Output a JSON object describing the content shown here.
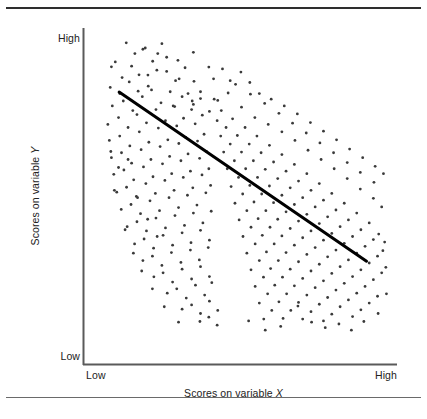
{
  "figure": {
    "title": "",
    "background": "#ffffff",
    "width": 427,
    "height": 419
  },
  "axes": {
    "y": {
      "title_prefix": "Scores on variable ",
      "title_variable": "Y",
      "title_full": "Scores on variable Y",
      "high_label": "High",
      "low_label": "Low",
      "line_color": "#5a5a5a"
    },
    "x": {
      "title_prefix": "Scores on variable ",
      "title_variable": "X",
      "title_full": "Scores on variable X",
      "low_label": "Low",
      "high_label": "High",
      "line_color": "#5a5a5a"
    }
  },
  "rules": {
    "top_color": "#2e2e2e",
    "bottom_color": "#6a6a6a"
  },
  "chart_data": {
    "type": "scatter",
    "title": "",
    "xlabel": "Scores on variable X",
    "ylabel": "Scores on variable Y",
    "xlim": [
      0,
      1
    ],
    "ylim": [
      0,
      1
    ],
    "xtick_labels": [
      "Low",
      "High"
    ],
    "ytick_labels": [
      "Low",
      "High"
    ],
    "grid": false,
    "legend": null,
    "relationship": "negative correlation",
    "point_color": "#3a3a3a",
    "point_size_px": 1.4,
    "trendline": {
      "color": "#000000",
      "width_px": 3,
      "x0": 0.088,
      "y0": 0.805,
      "x1": 0.921,
      "y1": 0.256
    },
    "points": [
      [
        0.075,
        0.903
      ],
      [
        0.112,
        0.965
      ],
      [
        0.141,
        0.93
      ],
      [
        0.062,
        0.887
      ],
      [
        0.098,
        0.852
      ],
      [
        0.13,
        0.889
      ],
      [
        0.168,
        0.944
      ],
      [
        0.201,
        0.905
      ],
      [
        0.058,
        0.82
      ],
      [
        0.09,
        0.8
      ],
      [
        0.122,
        0.838
      ],
      [
        0.155,
        0.861
      ],
      [
        0.186,
        0.824
      ],
      [
        0.215,
        0.876
      ],
      [
        0.248,
        0.918
      ],
      [
        0.065,
        0.76
      ],
      [
        0.102,
        0.776
      ],
      [
        0.134,
        0.745
      ],
      [
        0.166,
        0.79
      ],
      [
        0.197,
        0.812
      ],
      [
        0.229,
        0.77
      ],
      [
        0.26,
        0.806
      ],
      [
        0.29,
        0.848
      ],
      [
        0.32,
        0.8
      ],
      [
        0.05,
        0.7
      ],
      [
        0.086,
        0.722
      ],
      [
        0.118,
        0.69
      ],
      [
        0.148,
        0.732
      ],
      [
        0.18,
        0.705
      ],
      [
        0.212,
        0.748
      ],
      [
        0.244,
        0.712
      ],
      [
        0.275,
        0.758
      ],
      [
        0.305,
        0.72
      ],
      [
        0.338,
        0.765
      ],
      [
        0.368,
        0.73
      ],
      [
        0.055,
        0.648
      ],
      [
        0.09,
        0.662
      ],
      [
        0.124,
        0.63
      ],
      [
        0.156,
        0.676
      ],
      [
        0.188,
        0.642
      ],
      [
        0.22,
        0.688
      ],
      [
        0.252,
        0.65
      ],
      [
        0.282,
        0.695
      ],
      [
        0.312,
        0.658
      ],
      [
        0.344,
        0.702
      ],
      [
        0.374,
        0.668
      ],
      [
        0.062,
        0.592
      ],
      [
        0.096,
        0.608
      ],
      [
        0.13,
        0.574
      ],
      [
        0.162,
        0.618
      ],
      [
        0.195,
        0.586
      ],
      [
        0.226,
        0.628
      ],
      [
        0.258,
        0.596
      ],
      [
        0.289,
        0.638
      ],
      [
        0.32,
        0.604
      ],
      [
        0.352,
        0.646
      ],
      [
        0.382,
        0.612
      ],
      [
        0.07,
        0.538
      ],
      [
        0.104,
        0.552
      ],
      [
        0.137,
        0.52
      ],
      [
        0.17,
        0.562
      ],
      [
        0.202,
        0.53
      ],
      [
        0.234,
        0.572
      ],
      [
        0.265,
        0.54
      ],
      [
        0.296,
        0.582
      ],
      [
        0.328,
        0.548
      ],
      [
        0.359,
        0.59
      ],
      [
        0.39,
        0.556
      ],
      [
        0.08,
        0.48
      ],
      [
        0.113,
        0.496
      ],
      [
        0.146,
        0.466
      ],
      [
        0.178,
        0.508
      ],
      [
        0.21,
        0.476
      ],
      [
        0.242,
        0.518
      ],
      [
        0.273,
        0.486
      ],
      [
        0.304,
        0.528
      ],
      [
        0.336,
        0.494
      ],
      [
        0.367,
        0.536
      ],
      [
        0.396,
        0.502
      ],
      [
        0.095,
        0.424
      ],
      [
        0.128,
        0.44
      ],
      [
        0.16,
        0.41
      ],
      [
        0.192,
        0.452
      ],
      [
        0.224,
        0.42
      ],
      [
        0.256,
        0.462
      ],
      [
        0.288,
        0.43
      ],
      [
        0.318,
        0.47
      ],
      [
        0.35,
        0.438
      ],
      [
        0.38,
        0.478
      ],
      [
        0.115,
        0.368
      ],
      [
        0.148,
        0.384
      ],
      [
        0.18,
        0.354
      ],
      [
        0.212,
        0.396
      ],
      [
        0.244,
        0.364
      ],
      [
        0.276,
        0.404
      ],
      [
        0.308,
        0.372
      ],
      [
        0.338,
        0.412
      ],
      [
        0.37,
        0.38
      ],
      [
        0.398,
        0.418
      ],
      [
        0.14,
        0.312
      ],
      [
        0.172,
        0.328
      ],
      [
        0.204,
        0.298
      ],
      [
        0.236,
        0.34
      ],
      [
        0.268,
        0.308
      ],
      [
        0.3,
        0.348
      ],
      [
        0.33,
        0.316
      ],
      [
        0.362,
        0.356
      ],
      [
        0.392,
        0.324
      ],
      [
        0.168,
        0.258
      ],
      [
        0.2,
        0.272
      ],
      [
        0.232,
        0.242
      ],
      [
        0.264,
        0.284
      ],
      [
        0.296,
        0.252
      ],
      [
        0.328,
        0.292
      ],
      [
        0.358,
        0.26
      ],
      [
        0.388,
        0.3
      ],
      [
        0.205,
        0.205
      ],
      [
        0.236,
        0.218
      ],
      [
        0.268,
        0.188
      ],
      [
        0.3,
        0.23
      ],
      [
        0.332,
        0.198
      ],
      [
        0.362,
        0.238
      ],
      [
        0.392,
        0.206
      ],
      [
        0.25,
        0.152
      ],
      [
        0.282,
        0.166
      ],
      [
        0.314,
        0.136
      ],
      [
        0.345,
        0.178
      ],
      [
        0.376,
        0.146
      ],
      [
        0.4,
        0.186
      ],
      [
        0.3,
        0.1
      ],
      [
        0.332,
        0.114
      ],
      [
        0.362,
        0.086
      ],
      [
        0.392,
        0.126
      ],
      [
        0.42,
        0.096
      ],
      [
        0.36,
        0.06
      ],
      [
        0.39,
        0.074
      ],
      [
        0.418,
        0.048
      ],
      [
        0.152,
        0.808
      ],
      [
        0.185,
        0.86
      ],
      [
        0.218,
        0.93
      ],
      [
        0.248,
        0.872
      ],
      [
        0.278,
        0.842
      ],
      [
        0.31,
        0.884
      ],
      [
        0.34,
        0.84
      ],
      [
        0.27,
        0.76
      ],
      [
        0.3,
        0.79
      ],
      [
        0.332,
        0.748
      ],
      [
        0.362,
        0.784
      ],
      [
        0.392,
        0.742
      ],
      [
        0.42,
        0.778
      ],
      [
        0.418,
        0.712
      ],
      [
        0.43,
        0.662
      ],
      [
        0.44,
        0.61
      ],
      [
        0.452,
        0.556
      ],
      [
        0.465,
        0.498
      ],
      [
        0.478,
        0.444
      ],
      [
        0.492,
        0.39
      ],
      [
        0.505,
        0.336
      ],
      [
        0.518,
        0.282
      ],
      [
        0.532,
        0.228
      ],
      [
        0.546,
        0.174
      ],
      [
        0.56,
        0.12
      ],
      [
        0.575,
        0.068
      ],
      [
        0.432,
        0.745
      ],
      [
        0.448,
        0.69
      ],
      [
        0.462,
        0.636
      ],
      [
        0.476,
        0.582
      ],
      [
        0.49,
        0.528
      ],
      [
        0.504,
        0.474
      ],
      [
        0.518,
        0.42
      ],
      [
        0.532,
        0.366
      ],
      [
        0.546,
        0.312
      ],
      [
        0.56,
        0.258
      ],
      [
        0.574,
        0.204
      ],
      [
        0.588,
        0.15
      ],
      [
        0.602,
        0.096
      ],
      [
        0.47,
        0.718
      ],
      [
        0.486,
        0.664
      ],
      [
        0.5,
        0.61
      ],
      [
        0.514,
        0.556
      ],
      [
        0.528,
        0.502
      ],
      [
        0.542,
        0.448
      ],
      [
        0.556,
        0.394
      ],
      [
        0.57,
        0.34
      ],
      [
        0.584,
        0.286
      ],
      [
        0.598,
        0.232
      ],
      [
        0.612,
        0.178
      ],
      [
        0.626,
        0.124
      ],
      [
        0.64,
        0.07
      ],
      [
        0.512,
        0.69
      ],
      [
        0.526,
        0.636
      ],
      [
        0.54,
        0.582
      ],
      [
        0.554,
        0.528
      ],
      [
        0.568,
        0.474
      ],
      [
        0.582,
        0.42
      ],
      [
        0.596,
        0.366
      ],
      [
        0.61,
        0.312
      ],
      [
        0.624,
        0.258
      ],
      [
        0.638,
        0.204
      ],
      [
        0.652,
        0.15
      ],
      [
        0.666,
        0.096
      ],
      [
        0.552,
        0.662
      ],
      [
        0.566,
        0.608
      ],
      [
        0.58,
        0.554
      ],
      [
        0.594,
        0.5
      ],
      [
        0.608,
        0.446
      ],
      [
        0.622,
        0.392
      ],
      [
        0.636,
        0.338
      ],
      [
        0.65,
        0.284
      ],
      [
        0.664,
        0.23
      ],
      [
        0.678,
        0.176
      ],
      [
        0.692,
        0.122
      ],
      [
        0.706,
        0.068
      ],
      [
        0.594,
        0.632
      ],
      [
        0.608,
        0.578
      ],
      [
        0.622,
        0.524
      ],
      [
        0.636,
        0.47
      ],
      [
        0.65,
        0.416
      ],
      [
        0.664,
        0.362
      ],
      [
        0.678,
        0.308
      ],
      [
        0.692,
        0.254
      ],
      [
        0.706,
        0.2
      ],
      [
        0.72,
        0.146
      ],
      [
        0.734,
        0.092
      ],
      [
        0.636,
        0.602
      ],
      [
        0.65,
        0.548
      ],
      [
        0.664,
        0.494
      ],
      [
        0.678,
        0.44
      ],
      [
        0.692,
        0.386
      ],
      [
        0.706,
        0.332
      ],
      [
        0.72,
        0.278
      ],
      [
        0.734,
        0.224
      ],
      [
        0.748,
        0.17
      ],
      [
        0.762,
        0.116
      ],
      [
        0.776,
        0.062
      ],
      [
        0.678,
        0.57
      ],
      [
        0.692,
        0.516
      ],
      [
        0.706,
        0.462
      ],
      [
        0.72,
        0.408
      ],
      [
        0.734,
        0.354
      ],
      [
        0.748,
        0.3
      ],
      [
        0.762,
        0.246
      ],
      [
        0.776,
        0.192
      ],
      [
        0.79,
        0.138
      ],
      [
        0.804,
        0.084
      ],
      [
        0.72,
        0.54
      ],
      [
        0.734,
        0.486
      ],
      [
        0.748,
        0.432
      ],
      [
        0.762,
        0.378
      ],
      [
        0.776,
        0.324
      ],
      [
        0.79,
        0.27
      ],
      [
        0.804,
        0.216
      ],
      [
        0.818,
        0.162
      ],
      [
        0.832,
        0.108
      ],
      [
        0.762,
        0.508
      ],
      [
        0.776,
        0.454
      ],
      [
        0.79,
        0.4
      ],
      [
        0.804,
        0.346
      ],
      [
        0.818,
        0.292
      ],
      [
        0.832,
        0.238
      ],
      [
        0.846,
        0.184
      ],
      [
        0.86,
        0.13
      ],
      [
        0.874,
        0.076
      ],
      [
        0.804,
        0.476
      ],
      [
        0.818,
        0.422
      ],
      [
        0.832,
        0.368
      ],
      [
        0.846,
        0.314
      ],
      [
        0.86,
        0.26
      ],
      [
        0.874,
        0.206
      ],
      [
        0.888,
        0.152
      ],
      [
        0.902,
        0.098
      ],
      [
        0.846,
        0.444
      ],
      [
        0.86,
        0.39
      ],
      [
        0.874,
        0.336
      ],
      [
        0.888,
        0.282
      ],
      [
        0.902,
        0.228
      ],
      [
        0.916,
        0.174
      ],
      [
        0.93,
        0.12
      ],
      [
        0.888,
        0.412
      ],
      [
        0.902,
        0.358
      ],
      [
        0.916,
        0.304
      ],
      [
        0.93,
        0.25
      ],
      [
        0.944,
        0.196
      ],
      [
        0.958,
        0.142
      ],
      [
        0.93,
        0.38
      ],
      [
        0.944,
        0.326
      ],
      [
        0.958,
        0.272
      ],
      [
        0.972,
        0.218
      ],
      [
        0.962,
        0.344
      ],
      [
        0.976,
        0.29
      ],
      [
        0.455,
        0.802
      ],
      [
        0.5,
        0.756
      ],
      [
        0.545,
        0.722
      ],
      [
        0.59,
        0.7
      ],
      [
        0.636,
        0.676
      ],
      [
        0.68,
        0.648
      ],
      [
        0.724,
        0.616
      ],
      [
        0.768,
        0.586
      ],
      [
        0.812,
        0.556
      ],
      [
        0.856,
        0.524
      ],
      [
        0.9,
        0.49
      ],
      [
        0.944,
        0.46
      ],
      [
        0.972,
        0.432
      ],
      [
        0.48,
        0.83
      ],
      [
        0.53,
        0.798
      ],
      [
        0.578,
        0.768
      ],
      [
        0.626,
        0.736
      ],
      [
        0.672,
        0.704
      ],
      [
        0.718,
        0.672
      ],
      [
        0.764,
        0.64
      ],
      [
        0.81,
        0.608
      ],
      [
        0.856,
        0.576
      ],
      [
        0.9,
        0.544
      ],
      [
        0.946,
        0.512
      ],
      [
        0.69,
        0.11
      ],
      [
        0.736,
        0.058
      ],
      [
        0.782,
        0.04
      ],
      [
        0.828,
        0.052
      ],
      [
        0.87,
        0.032
      ],
      [
        0.912,
        0.06
      ],
      [
        0.632,
        0.044
      ],
      [
        0.58,
        0.032
      ],
      [
        0.524,
        0.062
      ],
      [
        0.96,
        0.086
      ],
      [
        0.988,
        0.15
      ],
      [
        0.986,
        0.236
      ],
      [
        0.982,
        0.318
      ],
      [
        0.176,
        0.948
      ],
      [
        0.232,
        0.962
      ],
      [
        0.286,
        0.908
      ],
      [
        0.338,
        0.934
      ],
      [
        0.39,
        0.886
      ],
      [
        0.118,
        0.586
      ],
      [
        0.15,
        0.462
      ],
      [
        0.184,
        0.392
      ],
      [
        0.216,
        0.336
      ],
      [
        0.086,
        0.56
      ],
      [
        0.072,
        0.486
      ],
      [
        0.06,
        0.612
      ],
      [
        0.108,
        0.358
      ],
      [
        0.136,
        0.282
      ],
      [
        0.164,
        0.224
      ],
      [
        0.2,
        0.166
      ],
      [
        0.24,
        0.108
      ],
      [
        0.288,
        0.058
      ],
      [
        0.406,
        0.848
      ],
      [
        0.436,
        0.88
      ],
      [
        0.462,
        0.842
      ],
      [
        0.498,
        0.87
      ],
      [
        0.528,
        0.836
      ],
      [
        0.362,
        0.806
      ],
      [
        0.334,
        0.776
      ],
      [
        0.408,
        0.782
      ],
      [
        0.56,
        0.8
      ],
      [
        0.6,
        0.782
      ],
      [
        0.644,
        0.76
      ],
      [
        0.688,
        0.734
      ],
      [
        0.732,
        0.706
      ],
      [
        0.776,
        0.678
      ],
      [
        0.82,
        0.65
      ],
      [
        0.864,
        0.62
      ],
      [
        0.908,
        0.592
      ],
      [
        0.95,
        0.564
      ],
      [
        0.978,
        0.54
      ]
    ]
  }
}
